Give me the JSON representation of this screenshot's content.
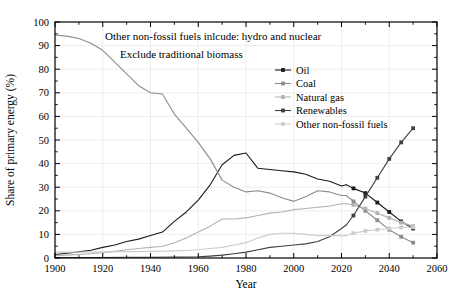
{
  "chart_data": {
    "type": "line",
    "title": "",
    "xlabel": "Year",
    "ylabel": "Share of primary energy (%)",
    "xlim": [
      1900,
      2060
    ],
    "ylim": [
      0,
      100
    ],
    "xticks": [
      1900,
      1920,
      1940,
      1960,
      1980,
      2000,
      2020,
      2040,
      2060
    ],
    "yticks": [
      0,
      10,
      20,
      30,
      40,
      50,
      60,
      70,
      80,
      90,
      100
    ],
    "minor_tick_step_x": 10,
    "minor_tick_step_y": 5,
    "grid": true,
    "legend_position": "upper-right-inside",
    "annotations": [
      "Other non-fossil fuels inlcude: hydro and nuclear",
      "Exclude traditional biomass"
    ],
    "series": [
      {
        "name": "Oil",
        "color": "#1a1a1a",
        "marker": "square",
        "history": {
          "x": [
            1900,
            1905,
            1910,
            1915,
            1920,
            1925,
            1930,
            1935,
            1940,
            1945,
            1950,
            1955,
            1960,
            1965,
            1970,
            1975,
            1980,
            1985,
            1990,
            1995,
            2000,
            2005,
            2010,
            2015,
            2020,
            2022
          ],
          "y": [
            1.5,
            2.0,
            2.6,
            3.3,
            4.5,
            5.5,
            7.0,
            8.0,
            9.5,
            11.0,
            15.5,
            19.5,
            24.5,
            31.0,
            39.5,
            43.5,
            44.5,
            38.0,
            37.5,
            37.0,
            36.5,
            35.5,
            33.5,
            32.5,
            30.5,
            31.0
          ]
        },
        "projection": {
          "x": [
            2025,
            2030,
            2035,
            2040,
            2045,
            2050
          ],
          "y": [
            29.5,
            27.5,
            23.5,
            19.5,
            15.5,
            12.5
          ]
        }
      },
      {
        "name": "Coal",
        "color": "#8c8c8c",
        "marker": "square",
        "history": {
          "x": [
            1900,
            1905,
            1910,
            1915,
            1920,
            1925,
            1930,
            1935,
            1940,
            1945,
            1950,
            1955,
            1960,
            1965,
            1970,
            1975,
            1980,
            1985,
            1990,
            1995,
            2000,
            2005,
            2010,
            2015,
            2020,
            2022
          ],
          "y": [
            94.5,
            94.0,
            93.0,
            91.0,
            88.0,
            83.0,
            78.0,
            73.0,
            70.0,
            69.5,
            61.0,
            55.0,
            49.0,
            42.0,
            33.0,
            30.0,
            28.0,
            28.5,
            27.5,
            25.5,
            24.0,
            26.0,
            28.5,
            28.0,
            26.5,
            26.5
          ]
        },
        "projection": {
          "x": [
            2025,
            2030,
            2035,
            2040,
            2045,
            2050
          ],
          "y": [
            24.0,
            20.0,
            16.0,
            12.0,
            9.0,
            6.5
          ]
        }
      },
      {
        "name": "Natural gas",
        "color": "#b3b3b3",
        "marker": "square",
        "history": {
          "x": [
            1900,
            1905,
            1910,
            1915,
            1920,
            1925,
            1930,
            1935,
            1940,
            1945,
            1950,
            1955,
            1960,
            1965,
            1970,
            1975,
            1980,
            1985,
            1990,
            1995,
            2000,
            2005,
            2010,
            2015,
            2020,
            2022
          ],
          "y": [
            1.0,
            1.2,
            1.5,
            1.8,
            2.2,
            2.8,
            3.5,
            4.0,
            4.5,
            5.0,
            6.5,
            8.5,
            11.0,
            13.5,
            16.5,
            16.5,
            17.0,
            18.0,
            19.0,
            19.5,
            20.5,
            21.0,
            21.5,
            22.0,
            23.0,
            23.0
          ]
        },
        "projection": {
          "x": [
            2025,
            2030,
            2035,
            2040,
            2045,
            2050
          ],
          "y": [
            22.5,
            21.0,
            19.0,
            17.0,
            15.0,
            13.5
          ]
        }
      },
      {
        "name": "Renewables",
        "color": "#404040",
        "marker": "square",
        "history": {
          "x": [
            1900,
            1910,
            1920,
            1930,
            1940,
            1950,
            1960,
            1965,
            1970,
            1975,
            1980,
            1985,
            1990,
            1995,
            2000,
            2005,
            2010,
            2015,
            2020,
            2022
          ],
          "y": [
            0.2,
            0.2,
            0.2,
            0.3,
            0.3,
            0.4,
            0.5,
            0.8,
            1.2,
            1.8,
            2.5,
            3.5,
            4.5,
            5.0,
            5.5,
            6.0,
            7.0,
            9.0,
            12.5,
            14.0
          ]
        },
        "projection": {
          "x": [
            2025,
            2030,
            2035,
            2040,
            2045,
            2050
          ],
          "y": [
            18.0,
            26.0,
            34.0,
            42.0,
            49.0,
            55.0
          ]
        }
      },
      {
        "name": "Other non-fossil fuels",
        "color": "#cccccc",
        "marker": "square",
        "history": {
          "x": [
            1900,
            1910,
            1920,
            1930,
            1940,
            1950,
            1955,
            1960,
            1965,
            1970,
            1975,
            1980,
            1985,
            1990,
            1995,
            2000,
            2005,
            2010,
            2015,
            2020,
            2022
          ],
          "y": [
            2.5,
            2.5,
            2.6,
            2.7,
            2.8,
            3.0,
            3.2,
            3.5,
            4.0,
            4.5,
            5.5,
            6.5,
            8.5,
            10.0,
            10.5,
            10.5,
            10.0,
            9.5,
            9.5,
            9.5,
            9.5
          ]
        },
        "projection": {
          "x": [
            2025,
            2030,
            2035,
            2040,
            2045,
            2050
          ],
          "y": [
            10.5,
            11.5,
            12.0,
            12.5,
            13.0,
            13.0
          ]
        }
      }
    ]
  },
  "legend": {
    "items": [
      {
        "label": "Oil"
      },
      {
        "label": "Coal"
      },
      {
        "label": "Natural gas"
      },
      {
        "label": "Renewables"
      },
      {
        "label": "Other non-fossil fuels"
      }
    ]
  },
  "colors": {
    "axis": "#000000",
    "grid": "#e8e8e8",
    "background": "#ffffff"
  }
}
